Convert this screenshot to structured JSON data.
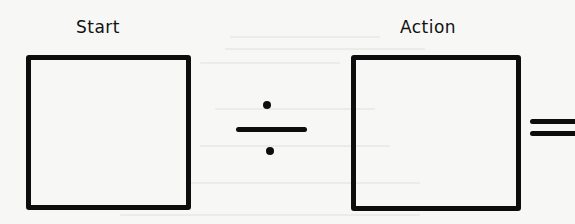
{
  "diagram": {
    "type": "equation-template",
    "operands": [
      {
        "label": "Start",
        "kind": "empty-box"
      },
      {
        "label": "Action",
        "kind": "empty-box"
      }
    ],
    "operator": {
      "symbol": "÷",
      "name": "divide"
    },
    "result_operator": {
      "symbol": "=",
      "name": "equals",
      "truncated": true
    }
  },
  "colors": {
    "ink": "#0d0d0d",
    "paper": "#f7f7f5"
  }
}
